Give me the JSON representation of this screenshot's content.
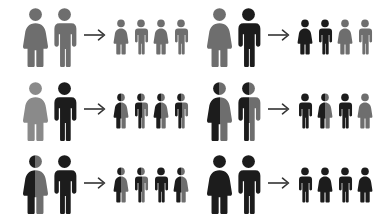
{
  "diagram": {
    "figure_label_female": "female-figure",
    "figure_label_male": "male-figure",
    "arrow_label": "produces-arrow",
    "arrow_glyph": "→"
  },
  "colors": {
    "background": "#ffffff",
    "gray": "#6e6e6e",
    "light_gray": "#8a8a8a",
    "black": "#1c1c1c",
    "arrow": "#333333"
  },
  "panels": [
    {
      "id": "panel-1",
      "row": 1,
      "column": 1,
      "parents": [
        {
          "sex": "female",
          "fill": "gray",
          "genotype": "homozygous-recessive"
        },
        {
          "sex": "male",
          "fill": "gray",
          "genotype": "homozygous-recessive"
        }
      ],
      "offspring": [
        {
          "sex": "female",
          "fill": "gray",
          "genotype": "homozygous-recessive"
        },
        {
          "sex": "male",
          "fill": "gray",
          "genotype": "homozygous-recessive"
        },
        {
          "sex": "female",
          "fill": "gray",
          "genotype": "homozygous-recessive"
        },
        {
          "sex": "male",
          "fill": "gray",
          "genotype": "homozygous-recessive"
        }
      ]
    },
    {
      "id": "panel-2",
      "row": 1,
      "column": 2,
      "parents": [
        {
          "sex": "female",
          "fill": "gray",
          "genotype": "homozygous-recessive"
        },
        {
          "sex": "male",
          "fill": "black",
          "genotype": "homozygous-dominant"
        }
      ],
      "offspring": [
        {
          "sex": "female",
          "fill": "black",
          "genotype": "heterozygous"
        },
        {
          "sex": "male",
          "fill": "black",
          "genotype": "heterozygous"
        },
        {
          "sex": "female",
          "fill": "gray",
          "genotype": "homozygous-recessive"
        },
        {
          "sex": "male",
          "fill": "gray",
          "genotype": "homozygous-recessive"
        }
      ]
    },
    {
      "id": "panel-3",
      "row": 2,
      "column": 1,
      "parents": [
        {
          "sex": "female",
          "fill": "light_gray",
          "genotype": "homozygous-recessive"
        },
        {
          "sex": "male",
          "fill": "black",
          "genotype": "homozygous-dominant"
        }
      ],
      "offspring": [
        {
          "sex": "female",
          "fill": "split",
          "genotype": "heterozygous"
        },
        {
          "sex": "male",
          "fill": "split",
          "genotype": "heterozygous"
        },
        {
          "sex": "female",
          "fill": "split",
          "genotype": "heterozygous"
        },
        {
          "sex": "male",
          "fill": "split",
          "genotype": "heterozygous"
        }
      ]
    },
    {
      "id": "panel-4",
      "row": 2,
      "column": 2,
      "parents": [
        {
          "sex": "female",
          "fill": "split",
          "genotype": "heterozygous"
        },
        {
          "sex": "male",
          "fill": "split",
          "genotype": "heterozygous"
        }
      ],
      "offspring": [
        {
          "sex": "male",
          "fill": "black",
          "genotype": "homozygous-dominant"
        },
        {
          "sex": "female",
          "fill": "split",
          "genotype": "heterozygous"
        },
        {
          "sex": "male",
          "fill": "black",
          "genotype": "homozygous-dominant"
        },
        {
          "sex": "female",
          "fill": "gray",
          "genotype": "homozygous-recessive"
        }
      ]
    },
    {
      "id": "panel-5",
      "row": 3,
      "column": 1,
      "parents": [
        {
          "sex": "female",
          "fill": "split",
          "genotype": "heterozygous"
        },
        {
          "sex": "male",
          "fill": "black",
          "genotype": "homozygous-dominant"
        }
      ],
      "offspring": [
        {
          "sex": "female",
          "fill": "split",
          "genotype": "heterozygous"
        },
        {
          "sex": "male",
          "fill": "split",
          "genotype": "heterozygous"
        },
        {
          "sex": "male",
          "fill": "black",
          "genotype": "homozygous-dominant"
        },
        {
          "sex": "female",
          "fill": "split",
          "genotype": "heterozygous"
        }
      ]
    },
    {
      "id": "panel-6",
      "row": 3,
      "column": 2,
      "parents": [
        {
          "sex": "female",
          "fill": "black",
          "genotype": "homozygous-dominant"
        },
        {
          "sex": "male",
          "fill": "black",
          "genotype": "homozygous-dominant"
        }
      ],
      "offspring": [
        {
          "sex": "male",
          "fill": "black",
          "genotype": "homozygous-dominant"
        },
        {
          "sex": "female",
          "fill": "black",
          "genotype": "homozygous-dominant"
        },
        {
          "sex": "male",
          "fill": "black",
          "genotype": "homozygous-dominant"
        },
        {
          "sex": "female",
          "fill": "black",
          "genotype": "homozygous-dominant"
        }
      ]
    }
  ]
}
